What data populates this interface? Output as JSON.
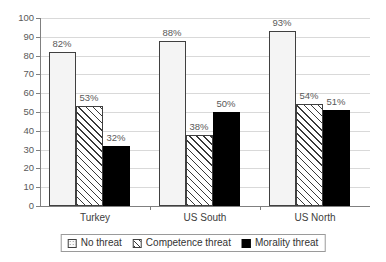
{
  "chart_data": {
    "type": "bar",
    "title": "",
    "xlabel": "",
    "ylabel": "",
    "ylim": [
      0,
      100
    ],
    "ytick_step": 10,
    "ytick_labels": [
      "100",
      "90",
      "80",
      "70",
      "60",
      "50",
      "40",
      "30",
      "20",
      "10",
      "0"
    ],
    "grid": true,
    "legend_position": "bottom",
    "categories": [
      "Turkey",
      "US South",
      "US North"
    ],
    "series": [
      {
        "name": "No threat",
        "pattern": "dotted",
        "values": [
          82,
          88,
          93
        ],
        "labels": [
          "82%",
          "88%",
          "93%"
        ]
      },
      {
        "name": "Competence threat",
        "pattern": "diagonal-hatch",
        "values": [
          53,
          38,
          54
        ],
        "labels": [
          "53%",
          "38%",
          "54%"
        ]
      },
      {
        "name": "Morality threat",
        "pattern": "solid-black",
        "values": [
          32,
          50,
          51
        ],
        "labels": [
          "32%",
          "50%",
          "51%"
        ]
      }
    ]
  },
  "colors": {
    "grid": "#d9d9d9",
    "axis": "#808080",
    "label_text": "#595959",
    "series_solid": "#000000"
  }
}
